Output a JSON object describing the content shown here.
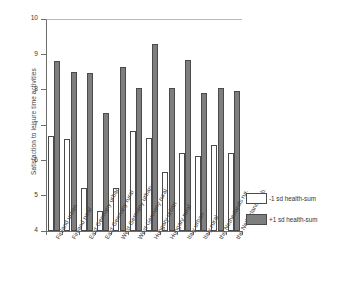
{
  "chart_data": {
    "type": "bar",
    "title": "",
    "subtitle": "",
    "xlabel": "",
    "ylabel": "Satisfaction to leisure time activities",
    "ylim": [
      4,
      10
    ],
    "yticks": [
      4,
      5,
      6,
      7,
      8,
      9,
      10
    ],
    "ytick_labels": [
      "4",
      "5",
      "6",
      "7",
      "8",
      "9",
      "10"
    ],
    "grid": false,
    "legend_position": "right",
    "categories": [
      "Finland urban",
      "Finland rural",
      "East Germany urban",
      "East Germany rural",
      "West Germany urban",
      "West Germany rural",
      "Hungary urban",
      "Hungary rural",
      "Italy urban",
      "Italy rural",
      "the Netherlands rur.",
      "the Netherlands urb."
    ],
    "series": [
      {
        "name": "-1 sd health-sum",
        "color": "#ffffff",
        "values": [
          6.7,
          6.6,
          5.22,
          4.58,
          5.22,
          6.82,
          6.64,
          5.68,
          6.21,
          6.11,
          6.44,
          6.22
        ]
      },
      {
        "name": "+1 sd health-sum",
        "color": "#7e7e7e",
        "values": [
          8.82,
          8.51,
          8.48,
          7.35,
          8.64,
          8.05,
          9.29,
          8.05,
          8.84,
          7.92,
          8.05,
          7.95
        ]
      }
    ]
  },
  "legend": {
    "entries": [
      {
        "label": "-1 sd health-sum",
        "swatch": "low"
      },
      {
        "label": "+1 sd health-sum",
        "swatch": "high"
      }
    ]
  },
  "axis": {
    "y_title": "Satisfaction to leisure time activities"
  }
}
